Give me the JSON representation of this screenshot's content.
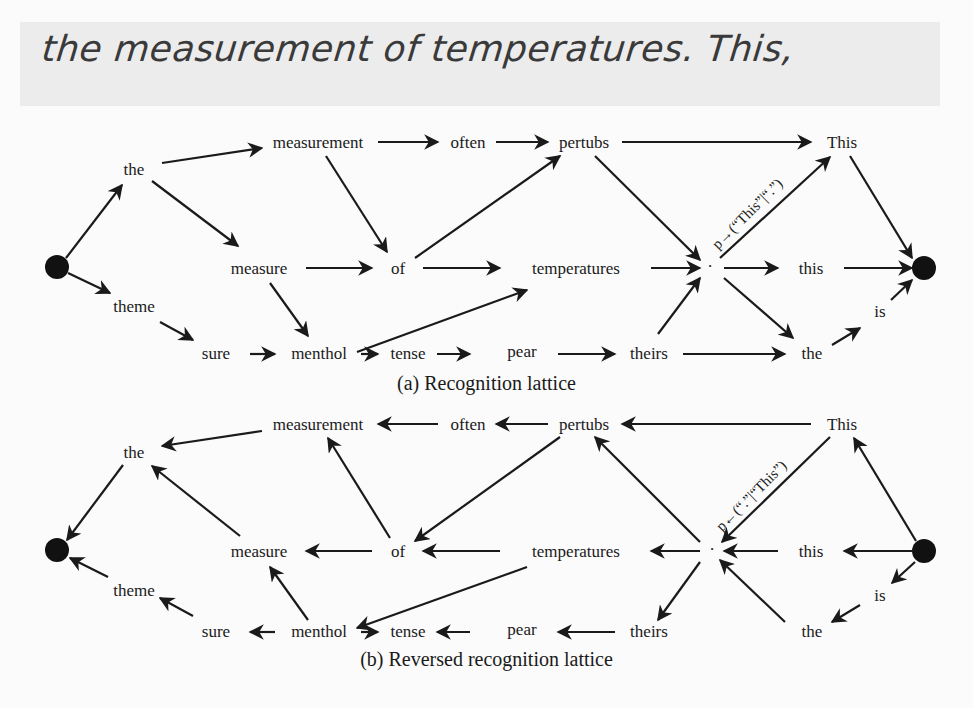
{
  "handwriting": {
    "text": "the measurement of temperatures. This,"
  },
  "lattice_a": {
    "caption": "(a) Recognition lattice",
    "edge_label": "p→(“This”|“.”)",
    "nodes": {
      "start": "",
      "the": "the",
      "theme": "theme",
      "measurement": "measurement",
      "often": "often",
      "pertubs": "pertubs",
      "This": "This",
      "measure": "measure",
      "of": "of",
      "temperatures": "temperatures",
      "dot": "·",
      "this": "this",
      "end": "",
      "sure": "sure",
      "menthol": "menthol",
      "tense": "tense",
      "pear": "pear",
      "theirs": "theirs",
      "the2": "the",
      "is": "is"
    }
  },
  "lattice_b": {
    "caption": "(b) Reversed recognition lattice",
    "edge_label": "p←(“.”|“This”)",
    "nodes": {
      "start": "",
      "the": "the",
      "theme": "theme",
      "measurement": "measurement",
      "often": "often",
      "pertubs": "pertubs",
      "This": "This",
      "measure": "measure",
      "of": "of",
      "temperatures": "temperatures",
      "dot": "·",
      "this": "this",
      "end": "",
      "sure": "sure",
      "menthol": "menthol",
      "tense": "tense",
      "pear": "pear",
      "theirs": "theirs",
      "the2": "the",
      "is": "is"
    }
  },
  "colors": {
    "ink": "#1a1a1a",
    "paper": "#fbfbfb",
    "band": "#ececec"
  }
}
